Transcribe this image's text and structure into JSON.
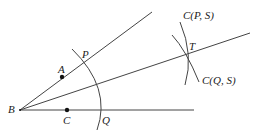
{
  "diagram": {
    "type": "angle-bisector-construction",
    "colors": {
      "line": "#444444",
      "point": "#111111",
      "text": "#222222"
    },
    "points": {
      "B": {
        "label": "B",
        "x": 20,
        "y": 110
      },
      "A": {
        "label": "A",
        "x": 62,
        "y": 77
      },
      "C": {
        "label": "C",
        "x": 67,
        "y": 110
      },
      "P": {
        "label": "P",
        "x": 83,
        "y": 63
      },
      "Q": {
        "label": "Q",
        "x": 100,
        "y": 110
      },
      "T": {
        "label": "T",
        "x": 187,
        "y": 55
      }
    },
    "circle_labels": {
      "cps": "C(P, S)",
      "cqs": "C(Q, S)"
    }
  }
}
